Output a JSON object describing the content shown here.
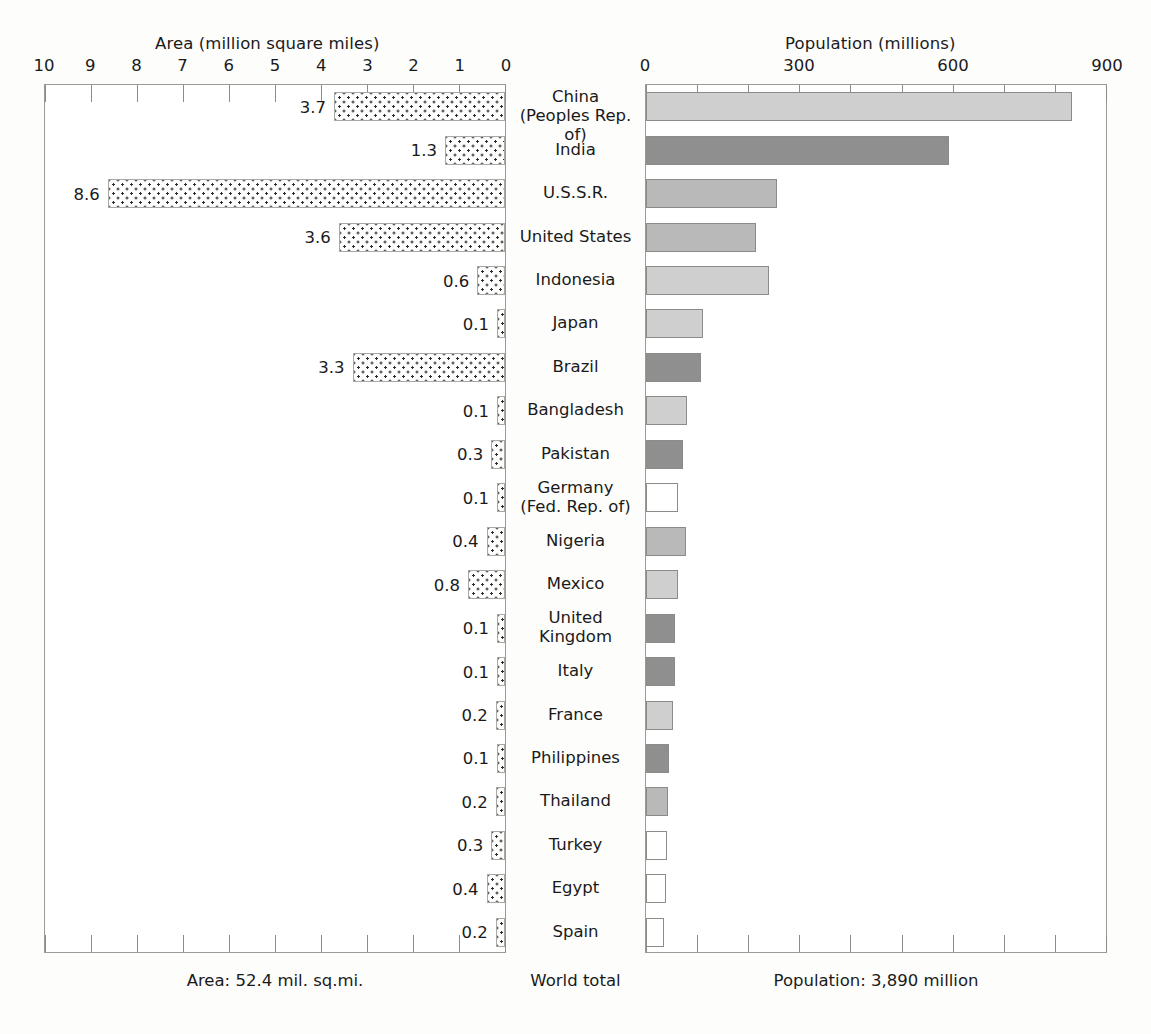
{
  "chart_data": {
    "type": "bar",
    "subtitle": "",
    "orientation": "horizontal-bilateral",
    "left_panel": {
      "axis_title": "Area (million square miles)",
      "tick_labels": [
        "10",
        "9",
        "8",
        "7",
        "6",
        "5",
        "4",
        "3",
        "2",
        "1",
        "0"
      ],
      "tick_values": [
        10,
        9,
        8,
        7,
        6,
        5,
        4,
        3,
        2,
        1,
        0
      ],
      "xlim": [
        10,
        0
      ],
      "reversed": true,
      "footer": "Area: 52.4 mil. sq.mi.",
      "unit": "million square miles"
    },
    "right_panel": {
      "axis_title": "Population (millions)",
      "tick_labels": [
        "0",
        "300",
        "600",
        "900"
      ],
      "tick_values": [
        0,
        300,
        600,
        900
      ],
      "minor_tick_step": 100,
      "xlim": [
        0,
        900
      ],
      "footer": "Population: 3,890 million",
      "unit": "millions"
    },
    "center_header_footer": "World total",
    "categories": [
      "China (Peoples Rep. of)",
      "India",
      "U.S.S.R.",
      "United States",
      "Indonesia",
      "Japan",
      "Brazil",
      "Bangladesh",
      "Pakistan",
      "Germany (Fed. Rep. of)",
      "Nigeria",
      "Mexico",
      "United Kingdom",
      "Italy",
      "France",
      "Philippines",
      "Thailand",
      "Turkey",
      "Egypt",
      "Spain"
    ],
    "series": [
      {
        "name": "Area (million square miles)",
        "values": [
          3.7,
          1.3,
          8.6,
          3.6,
          0.6,
          0.1,
          3.3,
          0.1,
          0.3,
          0.1,
          0.4,
          0.8,
          0.1,
          0.1,
          0.2,
          0.1,
          0.2,
          0.3,
          0.4,
          0.2
        ]
      },
      {
        "name": "Population (millions)",
        "values": [
          830,
          590,
          255,
          215,
          240,
          112,
          108,
          80,
          72,
          62,
          78,
          63,
          56,
          56,
          53,
          45,
          43,
          41,
          38,
          36
        ]
      }
    ],
    "legend": {
      "title": "Population per square mile",
      "position": "bottom-right-inside-plot",
      "entries": [
        {
          "label": "Under 100",
          "color": "#b9b9b9",
          "key": "under100"
        },
        {
          "label": "100-199",
          "color": "#ffffff",
          "key": "100-199"
        },
        {
          "label": "200-299",
          "color": "#cfcfcf",
          "key": "200-299"
        },
        {
          "label": "300 and over",
          "color": "#8f8f8f",
          "key": "300plus"
        }
      ]
    },
    "density_class_per_country": [
      "200-299",
      "300plus",
      "under100",
      "under100",
      "200-299",
      "200-299",
      "300plus",
      "200-299",
      "300plus",
      "100-199",
      "under100",
      "200-299",
      "300plus",
      "300plus",
      "200-299",
      "300plus",
      "under100",
      "100-199",
      "100-199",
      "100-199"
    ],
    "grid": false
  },
  "rows": [
    {
      "country_l1": "China",
      "country_l2": "(Peoples Rep. of)",
      "area": 3.7,
      "area_label": "3.7",
      "pop": 830,
      "shade": "200-299"
    },
    {
      "country_l1": "India",
      "country_l2": "",
      "area": 1.3,
      "area_label": "1.3",
      "pop": 590,
      "shade": "300plus"
    },
    {
      "country_l1": "U.S.S.R.",
      "country_l2": "",
      "area": 8.6,
      "area_label": "8.6",
      "pop": 255,
      "shade": "under100"
    },
    {
      "country_l1": "United States",
      "country_l2": "",
      "area": 3.6,
      "area_label": "3.6",
      "pop": 215,
      "shade": "under100"
    },
    {
      "country_l1": "Indonesia",
      "country_l2": "",
      "area": 0.6,
      "area_label": "0.6",
      "pop": 240,
      "shade": "200-299"
    },
    {
      "country_l1": "Japan",
      "country_l2": "",
      "area": 0.1,
      "area_label": "0.1",
      "pop": 112,
      "shade": "200-299"
    },
    {
      "country_l1": "Brazil",
      "country_l2": "",
      "area": 3.3,
      "area_label": "3.3",
      "pop": 108,
      "shade": "300plus"
    },
    {
      "country_l1": "Bangladesh",
      "country_l2": "",
      "area": 0.1,
      "area_label": "0.1",
      "pop": 80,
      "shade": "200-299"
    },
    {
      "country_l1": "Pakistan",
      "country_l2": "",
      "area": 0.3,
      "area_label": "0.3",
      "pop": 72,
      "shade": "300plus"
    },
    {
      "country_l1": "Germany",
      "country_l2": "(Fed. Rep. of)",
      "area": 0.1,
      "area_label": "0.1",
      "pop": 62,
      "shade": "100-199"
    },
    {
      "country_l1": "Nigeria",
      "country_l2": "",
      "area": 0.4,
      "area_label": "0.4",
      "pop": 78,
      "shade": "under100"
    },
    {
      "country_l1": "Mexico",
      "country_l2": "",
      "area": 0.8,
      "area_label": "0.8",
      "pop": 63,
      "shade": "200-299"
    },
    {
      "country_l1": "United",
      "country_l2": "Kingdom",
      "area": 0.1,
      "area_label": "0.1",
      "pop": 56,
      "shade": "300plus"
    },
    {
      "country_l1": "Italy",
      "country_l2": "",
      "area": 0.1,
      "area_label": "0.1",
      "pop": 56,
      "shade": "300plus"
    },
    {
      "country_l1": "France",
      "country_l2": "",
      "area": 0.2,
      "area_label": "0.2",
      "pop": 53,
      "shade": "200-299"
    },
    {
      "country_l1": "Philippines",
      "country_l2": "",
      "area": 0.1,
      "area_label": "0.1",
      "pop": 45,
      "shade": "300plus"
    },
    {
      "country_l1": "Thailand",
      "country_l2": "",
      "area": 0.2,
      "area_label": "0.2",
      "pop": 43,
      "shade": "under100"
    },
    {
      "country_l1": "Turkey",
      "country_l2": "",
      "area": 0.3,
      "area_label": "0.3",
      "pop": 41,
      "shade": "100-199"
    },
    {
      "country_l1": "Egypt",
      "country_l2": "",
      "area": 0.4,
      "area_label": "0.4",
      "pop": 38,
      "shade": "100-199"
    },
    {
      "country_l1": "Spain",
      "country_l2": "",
      "area": 0.2,
      "area_label": "0.2",
      "pop": 36,
      "shade": "100-199"
    }
  ],
  "top_ghost_text": ""
}
